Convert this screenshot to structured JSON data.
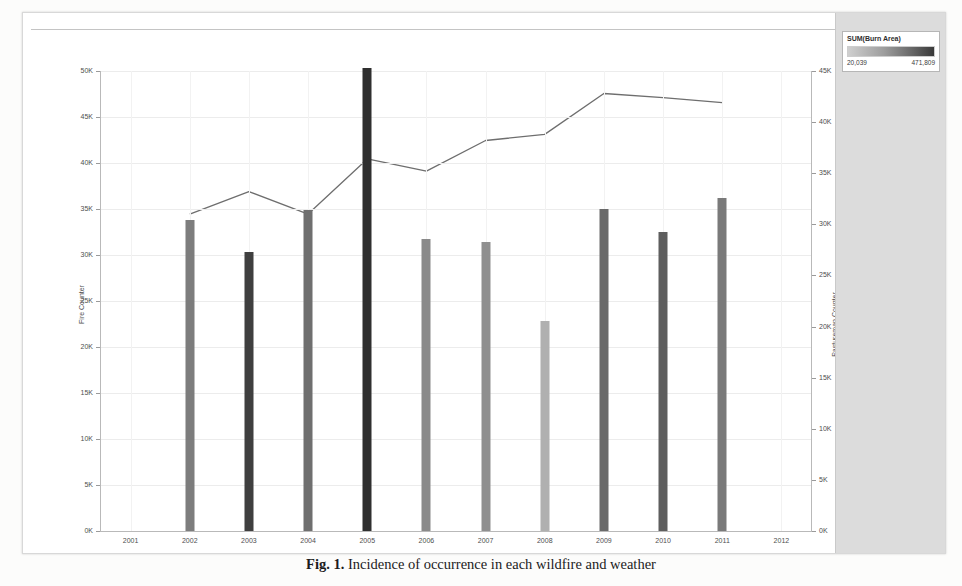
{
  "figure": {
    "caption_label": "Fig. 1.",
    "caption_text": "Incidence of occurrence in each wildfire and weather"
  },
  "legend": {
    "title": "SUM(Burn Area)",
    "min_label": "20,039",
    "max_label": "471,809",
    "ramp_from": "#cfcfcf",
    "ramp_to": "#3a3a3a"
  },
  "chart_data": {
    "type": "bar",
    "title": "",
    "xlabel": "Year",
    "ylabel": "Fire Counter",
    "y2label": "Pastureman Counter",
    "categories": [
      "2001",
      "2002",
      "2003",
      "2004",
      "2005",
      "2006",
      "2007",
      "2008",
      "2009",
      "2010",
      "2011",
      "2012"
    ],
    "ylim": [
      0,
      50000
    ],
    "y2lim": [
      0,
      45000
    ],
    "ytick_labels": [
      "0K",
      "5K",
      "10K",
      "15K",
      "20K",
      "25K",
      "30K",
      "35K",
      "40K",
      "45K",
      "50K"
    ],
    "ytick_values": [
      0,
      5000,
      10000,
      15000,
      20000,
      25000,
      30000,
      35000,
      40000,
      45000,
      50000
    ],
    "y2tick_labels": [
      "0K",
      "5K",
      "10K",
      "15K",
      "20K",
      "25K",
      "30K",
      "35K",
      "40K",
      "45K"
    ],
    "y2tick_values": [
      0,
      5000,
      10000,
      15000,
      20000,
      25000,
      30000,
      35000,
      40000,
      45000
    ],
    "grid": true,
    "legend_position": "right",
    "series": [
      {
        "name": "Fire Counter",
        "type": "bar",
        "axis": "left",
        "categories": [
          "2001",
          "2002",
          "2003",
          "2004",
          "2005",
          "2006",
          "2007",
          "2008",
          "2009",
          "2010",
          "2011",
          "2012"
        ],
        "values": [
          null,
          33800,
          30300,
          34900,
          50300,
          31700,
          31400,
          22800,
          35000,
          32500,
          36200,
          null
        ],
        "colors": [
          null,
          "#7d7d7d",
          "#3f3f3f",
          "#6f6f6f",
          "#2f2f2f",
          "#8a8a8a",
          "#8f8f8f",
          "#b0b0b0",
          "#6a6a6a",
          "#5e5e5e",
          "#7a7a7a",
          null
        ],
        "color_encoding": "SUM(Burn Area)"
      },
      {
        "name": "Pastureman Counter",
        "type": "line",
        "axis": "right",
        "categories": [
          "2001",
          "2002",
          "2003",
          "2004",
          "2005",
          "2006",
          "2007",
          "2008",
          "2009",
          "2010",
          "2011",
          "2012"
        ],
        "values": [
          null,
          31000,
          33200,
          31000,
          36400,
          35200,
          38200,
          38800,
          42800,
          42400,
          41900,
          null
        ],
        "color": "#6e6e6e"
      }
    ]
  }
}
